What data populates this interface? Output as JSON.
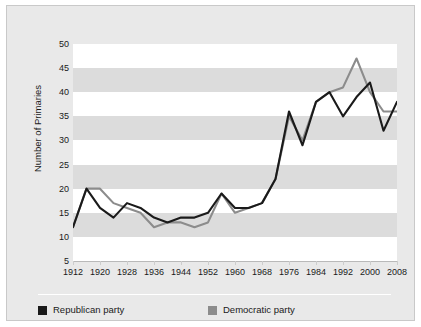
{
  "chart_data": {
    "type": "line",
    "title": "",
    "xlabel": "",
    "ylabel": "Number of Primaries",
    "xlim": [
      1912,
      2008
    ],
    "ylim": [
      5,
      50
    ],
    "yticks": [
      5,
      10,
      15,
      20,
      25,
      30,
      35,
      40,
      45,
      50
    ],
    "xticks": [
      1912,
      1920,
      1928,
      1936,
      1944,
      1952,
      1960,
      1968,
      1976,
      1984,
      1992,
      2000,
      2008
    ],
    "grid": "horizontal-banded",
    "legend_position": "bottom-left",
    "x": [
      1912,
      1916,
      1920,
      1924,
      1928,
      1932,
      1936,
      1940,
      1944,
      1948,
      1952,
      1956,
      1960,
      1964,
      1968,
      1972,
      1976,
      1980,
      1984,
      1988,
      1992,
      1996,
      2000,
      2004,
      2008
    ],
    "series": [
      {
        "name": "Republican party",
        "color": "#1a1a1a",
        "values": [
          12,
          20,
          16,
          14,
          17,
          16,
          14,
          13,
          14,
          14,
          15,
          19,
          16,
          16,
          17,
          22,
          36,
          29,
          38,
          40,
          35,
          39,
          42,
          32,
          38
        ]
      },
      {
        "name": "Democratic party",
        "color": "#8c8c8c",
        "values": [
          12,
          20,
          20,
          17,
          16,
          15,
          12,
          13,
          13,
          12,
          13,
          19,
          15,
          16,
          17,
          22,
          35,
          30,
          38,
          40,
          41,
          47,
          40,
          36,
          36
        ]
      }
    ]
  },
  "axes": {
    "y_title": "Number of Primaries",
    "y_tick_labels": [
      "50",
      "45",
      "40",
      "35",
      "30",
      "25",
      "20",
      "15",
      "10",
      "5"
    ],
    "x_tick_labels": [
      "1912",
      "1920",
      "1928",
      "1936",
      "1944",
      "1952",
      "1960",
      "1968",
      "1976",
      "1984",
      "1992",
      "2000",
      "2008"
    ]
  },
  "legend": {
    "items": [
      {
        "label": "Republican party",
        "color": "#1a1a1a"
      },
      {
        "label": "Democratic party",
        "color": "#8c8c8c"
      }
    ]
  },
  "colors": {
    "republican": "#1a1a1a",
    "democratic": "#8c8c8c",
    "panel_background": "#e9e9e9",
    "plot_background": "#ffffff",
    "band": "#dcdcdc",
    "frame": "#c9c9c9"
  }
}
